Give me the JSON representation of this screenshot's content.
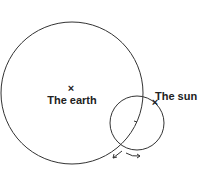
{
  "diagram": {
    "labels": {
      "earth": "The earth",
      "sun": "The sun"
    },
    "earth_center_marker": "×",
    "sun_marker": "×",
    "colors": {
      "stroke": "#333333",
      "background": "#ffffff"
    }
  }
}
